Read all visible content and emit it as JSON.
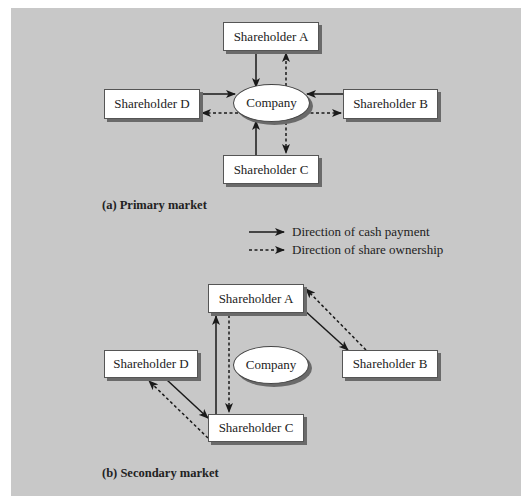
{
  "primary": {
    "caption": "(a) Primary market",
    "nodes": {
      "shareholder_a": "Shareholder A",
      "shareholder_b": "Shareholder B",
      "shareholder_c": "Shareholder C",
      "shareholder_d": "Shareholder D",
      "company": "Company"
    },
    "edges": [
      {
        "from": "Shareholder A",
        "to": "Company",
        "type": "cash payment"
      },
      {
        "from": "Company",
        "to": "Shareholder A",
        "type": "share ownership"
      },
      {
        "from": "Shareholder B",
        "to": "Company",
        "type": "cash payment"
      },
      {
        "from": "Company",
        "to": "Shareholder B",
        "type": "share ownership"
      },
      {
        "from": "Shareholder C",
        "to": "Company",
        "type": "cash payment"
      },
      {
        "from": "Company",
        "to": "Shareholder C",
        "type": "share ownership"
      },
      {
        "from": "Shareholder D",
        "to": "Company",
        "type": "cash payment"
      },
      {
        "from": "Company",
        "to": "Shareholder D",
        "type": "share ownership"
      }
    ]
  },
  "legend": {
    "solid": "Direction of cash payment",
    "dashed": "Direction of share ownership"
  },
  "secondary": {
    "caption": "(b) Secondary market",
    "nodes": {
      "shareholder_a": "Shareholder A",
      "shareholder_b": "Shareholder B",
      "shareholder_c": "Shareholder C",
      "shareholder_d": "Shareholder D",
      "company": "Company"
    },
    "edges": [
      {
        "from": "Shareholder C",
        "to": "Shareholder A",
        "type": "cash payment"
      },
      {
        "from": "Shareholder A",
        "to": "Shareholder C",
        "type": "share ownership"
      },
      {
        "from": "Shareholder A",
        "to": "Shareholder B",
        "type": "cash payment"
      },
      {
        "from": "Shareholder B",
        "to": "Shareholder A",
        "type": "share ownership"
      },
      {
        "from": "Shareholder D",
        "to": "Shareholder C",
        "type": "cash payment"
      },
      {
        "from": "Shareholder C",
        "to": "Shareholder D",
        "type": "share ownership"
      }
    ]
  },
  "colors": {
    "panel_background": "#c8c8c8",
    "box_fill": "#ffffff",
    "shadow": "#6a6a6a",
    "line": "#1a1a1a"
  }
}
